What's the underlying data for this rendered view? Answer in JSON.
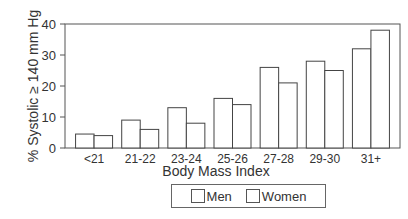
{
  "chart_data": {
    "type": "bar",
    "title": "",
    "xlabel": "Body Mass Index",
    "ylabel": "% Systolic ≥ 140 mm Hg",
    "ylim": [
      0,
      40
    ],
    "yticks": [
      0,
      10,
      20,
      30,
      40
    ],
    "grid": false,
    "legend_position": "bottom",
    "categories": [
      "<21",
      "21-22",
      "23-24",
      "25-26",
      "27-28",
      "29-30",
      "31+"
    ],
    "series": [
      {
        "name": "Men",
        "values": [
          4.5,
          9,
          13,
          16,
          26,
          28,
          32
        ],
        "color": "#ffffff"
      },
      {
        "name": "Women",
        "values": [
          4,
          6,
          8,
          14,
          21,
          25,
          38
        ],
        "color": "#ffffff"
      }
    ]
  },
  "legend": {
    "men_label": "Men",
    "women_label": "Women"
  }
}
